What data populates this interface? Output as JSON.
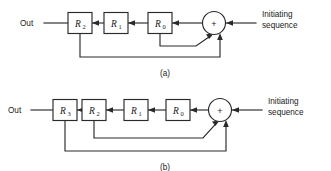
{
  "figure": {
    "background_color": "#ffffff",
    "line_color": "#2a2a2a",
    "panels": [
      {
        "id": "a",
        "caption": "(a)",
        "output_label": "Out",
        "input_label_line1": "Initiating",
        "input_label_line2": "sequence",
        "adder_symbol": "+",
        "adder_name": "modulo-2-adder",
        "stages": [
          {
            "name": "R",
            "subscript": "2"
          },
          {
            "name": "R",
            "subscript": "1"
          },
          {
            "name": "R",
            "subscript": "0"
          }
        ],
        "feedback_taps": [
          "R0",
          "R2"
        ]
      },
      {
        "id": "b",
        "caption": "(b)",
        "output_label": "Out",
        "input_label_line1": "Initiating",
        "input_label_line2": "sequence",
        "adder_symbol": "+",
        "adder_name": "modulo-2-adder",
        "stages": [
          {
            "name": "R",
            "subscript": "3"
          },
          {
            "name": "R",
            "subscript": "2"
          },
          {
            "name": "R",
            "subscript": "1"
          },
          {
            "name": "R",
            "subscript": "0"
          }
        ],
        "feedback_taps": [
          "R1",
          "R3"
        ]
      }
    ]
  }
}
